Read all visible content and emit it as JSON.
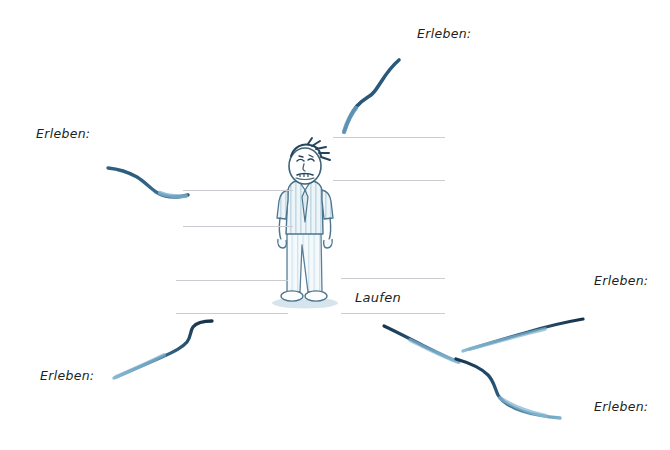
{
  "document": {
    "type": "worksheet",
    "language": "de",
    "background_color": "#ffffff",
    "ink_color": "#1d3a52",
    "rule_color": "#c9cdd2",
    "text_color": "#231f20"
  },
  "center": {
    "figure_name": "standing-man-grimacing",
    "description": "hand-drawn cartoon man with worried grimacing face, striped short-sleeve shirt, tie, light striped trousers and white shoes"
  },
  "prompts": [
    {
      "id": "top",
      "label": "Erleben:",
      "x": 417,
      "y": 28
    },
    {
      "id": "left",
      "label": "Erleben:",
      "x": 36,
      "y": 128
    },
    {
      "id": "bottom-left",
      "label": "Erleben:",
      "x": 40,
      "y": 370
    },
    {
      "id": "right",
      "label": "Erleben:",
      "x": 594,
      "y": 275
    },
    {
      "id": "bottom-right",
      "label": "Erleben:",
      "x": 594,
      "y": 401
    }
  ],
  "answers": [
    {
      "id": "laufen",
      "value": "Laufen",
      "x": 355,
      "y": 291
    }
  ],
  "writing_slots": [
    {
      "id": "slot-top-right",
      "x": 333,
      "y": 137,
      "width": 112
    },
    {
      "id": "slot-top-right-2",
      "x": 333,
      "y": 180,
      "width": 112
    },
    {
      "id": "slot-left-upper",
      "x": 183,
      "y": 190,
      "width": 110
    },
    {
      "id": "slot-left-lower",
      "x": 183,
      "y": 226,
      "width": 110
    },
    {
      "id": "slot-left-bottom",
      "x": 176,
      "y": 280,
      "width": 112
    },
    {
      "id": "slot-left-bottom-2",
      "x": 176,
      "y": 313,
      "width": 112
    },
    {
      "id": "slot-laufen-top",
      "x": 341,
      "y": 278,
      "width": 104
    },
    {
      "id": "slot-laufen-bot",
      "x": 341,
      "y": 313,
      "width": 104
    }
  ],
  "strokes": [
    {
      "id": "stroke-top",
      "name": "brush-stroke-up-right"
    },
    {
      "id": "stroke-left",
      "name": "brush-stroke-left-s-curve"
    },
    {
      "id": "stroke-bottom-left",
      "name": "brush-stroke-bottom-left-rising"
    },
    {
      "id": "stroke-bottom-mid",
      "name": "brush-stroke-down-right"
    },
    {
      "id": "stroke-right-up",
      "name": "brush-stroke-right-rising"
    },
    {
      "id": "stroke-right-down",
      "name": "brush-stroke-right-descending"
    }
  ]
}
